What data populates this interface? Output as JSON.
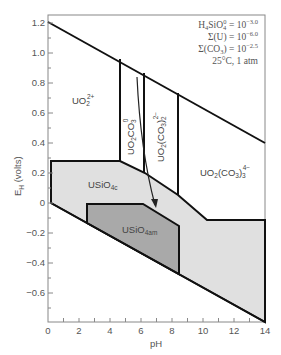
{
  "diagram": {
    "type": "Eh-pH (Pourbaix) diagram",
    "x_axis": {
      "label": "pH",
      "ticks": [
        "0",
        "2",
        "4",
        "6",
        "8",
        "10",
        "12",
        "14"
      ],
      "range": [
        0,
        14
      ]
    },
    "y_axis": {
      "label_main": "E",
      "label_sub": "H",
      "label_unit": " (volts)",
      "ticks": [
        "1.2",
        "1.0",
        "0.8",
        "0.6",
        "0.4",
        "0.2",
        "0",
        "−0.2",
        "−0.4",
        "−0.6"
      ],
      "range": [
        -0.8,
        1.25
      ]
    },
    "conditions": {
      "line1_a": "H",
      "line1_b": "4",
      "line1_c": "SiO",
      "line1_d": "4",
      "line1_e": "0",
      "line1_f": " = 10",
      "line1_exp": "−3.0",
      "line2": "Σ(U) = 10",
      "line2_exp": "−6.0",
      "line3_a": "Σ(CO",
      "line3_b": "3",
      "line3_c": ") = 10",
      "line3_exp": "−2.5",
      "line4": "25°C, 1 atm"
    },
    "regions": {
      "uo2": {
        "main": "UO",
        "sub": "2",
        "sup": "2+"
      },
      "uo2co3": {
        "main1": "UO",
        "sub1": "2",
        "main2": "CO",
        "sub2": "3",
        "sup": "0"
      },
      "uo2co3_2": {
        "main1": "UO",
        "sub1": "2",
        "main2": "(CO",
        "sub2": "3",
        "main3": ")",
        "sub3": "2",
        "sup": "2−"
      },
      "uo2co3_3": {
        "main1": "UO",
        "sub1": "2",
        "main2": "(CO",
        "sub2": "3",
        "main3": ")",
        "sub3": "3",
        "sup": "4−"
      },
      "usio4c": {
        "main": "USiO",
        "sub": "4c"
      },
      "usio4am": {
        "main": "USiO",
        "sub": "4am"
      }
    },
    "colors": {
      "crystalline_fill": "#e0e0e0",
      "amorphous_fill": "#a9a9a9",
      "line": "#111111",
      "axis": "#777777"
    }
  }
}
